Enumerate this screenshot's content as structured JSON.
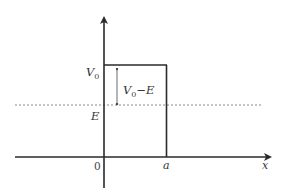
{
  "diagram": {
    "axes": {
      "x_label": "x",
      "origin_label": "0"
    },
    "barrier": {
      "height_label": "V",
      "height_subscript": "0",
      "width_label": "a"
    },
    "energy": {
      "label": "E",
      "line_style": "dashed"
    },
    "difference": {
      "label_main": "V",
      "label_subscript": "0",
      "label_suffix": "−E"
    },
    "colors": {
      "axis": "#2a2a2a",
      "barrier": "#2a2a2a",
      "dashed": "#8a8a8a",
      "text": "#333333"
    }
  }
}
